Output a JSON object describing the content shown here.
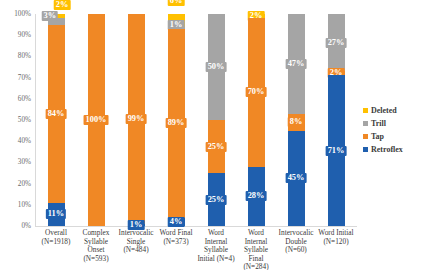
{
  "chart_data": {
    "type": "bar",
    "subtype": "stacked-percent",
    "title": "",
    "xlabel": "",
    "ylabel": "",
    "ylim": [
      0,
      100
    ],
    "grid": false,
    "legend_position": "right",
    "ytick_labels": [
      "100%",
      "90%",
      "80%",
      "70%",
      "60%",
      "50%",
      "40%",
      "30%",
      "20%",
      "10%",
      "0%"
    ],
    "ytick_values": [
      100,
      90,
      80,
      70,
      60,
      50,
      40,
      30,
      20,
      10,
      0
    ],
    "categories": [
      "Overall\n(N=1918)",
      "Complex\nSyllable\nOnset\n(N=593)",
      "Intervocalic\nSingle\n(N=484)",
      "Word Final\n(N=373)",
      "Word\nInternal\nSyllable\nInitial (N=4)",
      "Word\nInternal\nSyllable Final\n(N=284)",
      "Intervocalic\nDouble\n(N=60)",
      "Word Initial\n(N=120)"
    ],
    "category_names": [
      "Overall",
      "Complex Syllable Onset",
      "Intervocalic Single",
      "Word Final",
      "Word Internal Syllable Initial",
      "Word Internal Syllable Final",
      "Intervocalic Double",
      "Word Initial"
    ],
    "category_counts": [
      1918,
      593,
      484,
      373,
      4,
      284,
      60,
      120
    ],
    "series": [
      {
        "name": "Retroflex",
        "color": "#1F5FAE",
        "values": [
          11,
          0,
          1,
          4,
          25,
          28,
          45,
          71
        ]
      },
      {
        "name": "Tap",
        "color": "#F08825",
        "values": [
          84,
          100,
          99,
          89,
          25,
          70,
          8,
          2
        ]
      },
      {
        "name": "Trill",
        "color": "#A5A5A5",
        "values": [
          3,
          0,
          0,
          1,
          50,
          0,
          47,
          27
        ]
      },
      {
        "name": "Deleted",
        "color": "#FFC000",
        "values": [
          2,
          0,
          0,
          6,
          0,
          2,
          0,
          0
        ]
      }
    ],
    "legend": [
      {
        "label": "Deleted",
        "color": "#FFC000"
      },
      {
        "label": "Trill",
        "color": "#A5A5A5"
      },
      {
        "label": "Tap",
        "color": "#F08825"
      },
      {
        "label": "Retroflex",
        "color": "#1F5FAE"
      }
    ],
    "bars": [
      {
        "category": "Overall",
        "count_label": "(N=1918)",
        "label_lines": [
          "Overall",
          "(N=1918)"
        ],
        "segments": [
          {
            "series": "Retroflex",
            "value": 11,
            "label": "11%",
            "color": "#1F5FAE",
            "label_position": "inside"
          },
          {
            "series": "Tap",
            "value": 84,
            "label": "84%",
            "color": "#F08825",
            "label_position": "inside"
          },
          {
            "series": "Trill",
            "value": 3,
            "label": "3%",
            "color": "#A5A5A5",
            "label_position": "outside-left"
          },
          {
            "series": "Deleted",
            "value": 2,
            "label": "2%",
            "color": "#FFC000",
            "label_position": "outside-right"
          }
        ]
      },
      {
        "category": "Complex Syllable Onset",
        "count_label": "(N=593)",
        "label_lines": [
          "Complex",
          "Syllable",
          "Onset",
          "(N=593)"
        ],
        "segments": [
          {
            "series": "Tap",
            "value": 100,
            "label": "100%",
            "color": "#F08825",
            "label_position": "inside"
          }
        ]
      },
      {
        "category": "Intervocalic Single",
        "count_label": "(N=484)",
        "label_lines": [
          "Intervocalic",
          "Single",
          "(N=484)"
        ],
        "segments": [
          {
            "series": "Retroflex",
            "value": 1,
            "label": "1%",
            "color": "#1F5FAE",
            "label_position": "inside"
          },
          {
            "series": "Tap",
            "value": 99,
            "label": "99%",
            "color": "#F08825",
            "label_position": "inside"
          }
        ]
      },
      {
        "category": "Word Final",
        "count_label": "(N=373)",
        "label_lines": [
          "Word Final",
          "(N=373)"
        ],
        "segments": [
          {
            "series": "Retroflex",
            "value": 4,
            "label": "4%",
            "color": "#1F5FAE",
            "label_position": "inside"
          },
          {
            "series": "Tap",
            "value": 89,
            "label": "89%",
            "color": "#F08825",
            "label_position": "inside"
          },
          {
            "series": "Trill",
            "value": 1,
            "label": "1%",
            "color": "#A5A5A5",
            "label_position": "outside-low"
          },
          {
            "series": "Deleted",
            "value": 6,
            "label": "6%",
            "color": "#FFC000",
            "label_position": "outside-high"
          }
        ]
      },
      {
        "category": "Word Internal Syllable Initial",
        "count_label": "(N=4)",
        "label_lines": [
          "Word",
          "Internal",
          "Syllable",
          "Initial (N=4)"
        ],
        "segments": [
          {
            "series": "Retroflex",
            "value": 25,
            "label": "25%",
            "color": "#1F5FAE",
            "label_position": "inside"
          },
          {
            "series": "Tap",
            "value": 25,
            "label": "25%",
            "color": "#F08825",
            "label_position": "inside"
          },
          {
            "series": "Trill",
            "value": 50,
            "label": "50%",
            "color": "#A5A5A5",
            "label_position": "inside"
          }
        ]
      },
      {
        "category": "Word Internal Syllable Final",
        "count_label": "(N=284)",
        "label_lines": [
          "Word",
          "Internal",
          "Syllable Final",
          "(N=284)"
        ],
        "segments": [
          {
            "series": "Retroflex",
            "value": 28,
            "label": "28%",
            "color": "#1F5FAE",
            "label_position": "inside"
          },
          {
            "series": "Tap",
            "value": 70,
            "label": "70%",
            "color": "#F08825",
            "label_position": "inside"
          },
          {
            "series": "Deleted",
            "value": 2,
            "label": "2%",
            "color": "#FFC000",
            "label_position": "inside"
          }
        ]
      },
      {
        "category": "Intervocalic Double",
        "count_label": "(N=60)",
        "label_lines": [
          "Intervocalic",
          "Double",
          "(N=60)"
        ],
        "segments": [
          {
            "series": "Retroflex",
            "value": 45,
            "label": "45%",
            "color": "#1F5FAE",
            "label_position": "inside"
          },
          {
            "series": "Tap",
            "value": 8,
            "label": "8%",
            "color": "#F08825",
            "label_position": "inside"
          },
          {
            "series": "Trill",
            "value": 47,
            "label": "47%",
            "color": "#A5A5A5",
            "label_position": "inside"
          }
        ]
      },
      {
        "category": "Word Initial",
        "count_label": "(N=120)",
        "label_lines": [
          "Word Initial",
          "(N=120)"
        ],
        "segments": [
          {
            "series": "Retroflex",
            "value": 71,
            "label": "71%",
            "color": "#1F5FAE",
            "label_position": "inside"
          },
          {
            "series": "Tap",
            "value": 2,
            "label": "2%",
            "color": "#F08825",
            "label_position": "inside"
          },
          {
            "series": "Trill",
            "value": 27,
            "label": "27%",
            "color": "#A5A5A5",
            "label_position": "inside"
          }
        ]
      }
    ]
  }
}
